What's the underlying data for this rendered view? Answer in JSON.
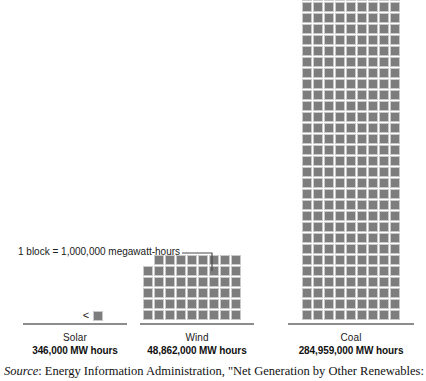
{
  "chart_data": {
    "type": "bar",
    "subtype": "pictogram-unit-blocks",
    "title": "",
    "xlabel": "",
    "ylabel": "",
    "unit_label": "1 block = 1,000,000 megawatt-hours",
    "unit_value": 1000000,
    "unit_name": "megawatt-hours",
    "blocks_per_row": 9,
    "categories": [
      "Solar",
      "Wind",
      "Coal"
    ],
    "values": [
      346000,
      48862000,
      284959000
    ],
    "value_labels": [
      "346,000 MW hours",
      "48,862,000 MW hours",
      "284,959,000 MW hours"
    ],
    "blocks": [
      1,
      53,
      285
    ],
    "block_layout": [
      {
        "name": "Solar",
        "full_rows": 0,
        "partial_row": 1,
        "less_than_marker": "<"
      },
      {
        "name": "Wind",
        "full_rows": 5,
        "partial_row": 8
      },
      {
        "name": "Coal",
        "full_rows": 31,
        "partial_row": 5
      }
    ],
    "grid": false,
    "legend": "none",
    "block_color": "#7d7d7d",
    "block_border_color": "#c9c9c9",
    "baseline_color": "#8d8d8d"
  },
  "legend": {
    "text": "1 block = 1,000,000 megawatt-hours"
  },
  "columns": [
    {
      "id": "solar",
      "name": "Solar",
      "value": "346,000 MW hours",
      "marker": "<"
    },
    {
      "id": "wind",
      "name": "Wind",
      "value": "48,862,000 MW hours"
    },
    {
      "id": "coal",
      "name": "Coal",
      "value": "284,959,000 MW hours"
    }
  ],
  "source": {
    "label": "Source",
    "text": ": Energy Information Administration, \"Net Generation by Other Renewables:"
  }
}
